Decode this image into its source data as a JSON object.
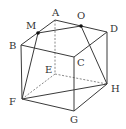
{
  "figure": {
    "type": "cube-geometry",
    "vertices": {
      "A": {
        "label": "A",
        "x": 55,
        "y": 20,
        "lx": 52,
        "ly": 16
      },
      "B": {
        "label": "B",
        "x": 21,
        "y": 45,
        "lx": 9,
        "ly": 49
      },
      "C": {
        "label": "C",
        "x": 74,
        "y": 57,
        "lx": 77,
        "ly": 66
      },
      "D": {
        "label": "D",
        "x": 107,
        "y": 32,
        "lx": 110,
        "ly": 32
      },
      "E": {
        "label": "E",
        "x": 55,
        "y": 74,
        "lx": 45,
        "ly": 73
      },
      "F": {
        "label": "F",
        "x": 22,
        "y": 99,
        "lx": 9,
        "ly": 105
      },
      "G": {
        "label": "G",
        "x": 74,
        "y": 111,
        "lx": 70,
        "ly": 123
      },
      "H": {
        "label": "H",
        "x": 107,
        "y": 84,
        "lx": 111,
        "ly": 92
      },
      "M": {
        "label": "M",
        "x": 38,
        "y": 33,
        "lx": 26,
        "ly": 29
      },
      "O": {
        "label": "O",
        "x": 81,
        "y": 26,
        "lx": 77,
        "ly": 19
      }
    },
    "solid_edges": [
      [
        "A",
        "B"
      ],
      [
        "A",
        "D"
      ],
      [
        "B",
        "C"
      ],
      [
        "C",
        "D"
      ],
      [
        "B",
        "F"
      ],
      [
        "C",
        "G"
      ],
      [
        "D",
        "H"
      ],
      [
        "F",
        "G"
      ],
      [
        "G",
        "H"
      ],
      [
        "M",
        "O"
      ],
      [
        "M",
        "F"
      ],
      [
        "O",
        "H"
      ],
      [
        "F",
        "H"
      ]
    ],
    "hidden_edges": [
      [
        "A",
        "E"
      ],
      [
        "E",
        "F"
      ],
      [
        "E",
        "H"
      ]
    ],
    "marked_points": [
      "M",
      "O"
    ]
  }
}
